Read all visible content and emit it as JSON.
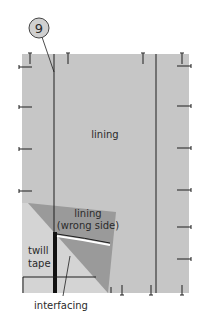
{
  "diagram": {
    "step_number": "9",
    "labels": {
      "lining": "lining",
      "lining_wrong_side_line1": "lining",
      "lining_wrong_side_line2": "(wrong side)",
      "twill_tape_line1": "twill",
      "twill_tape_line2": "tape",
      "interfacing": "interfacing"
    },
    "colors": {
      "background": "#ffffff",
      "lining_fabric": "#c6c6c6",
      "folded_lining_wrong_side": "#9a9a9a",
      "interfacing_area": "#d6d6d6",
      "lines": "#1e1e1e",
      "step_circle_fill": "#d0d0d0"
    }
  }
}
